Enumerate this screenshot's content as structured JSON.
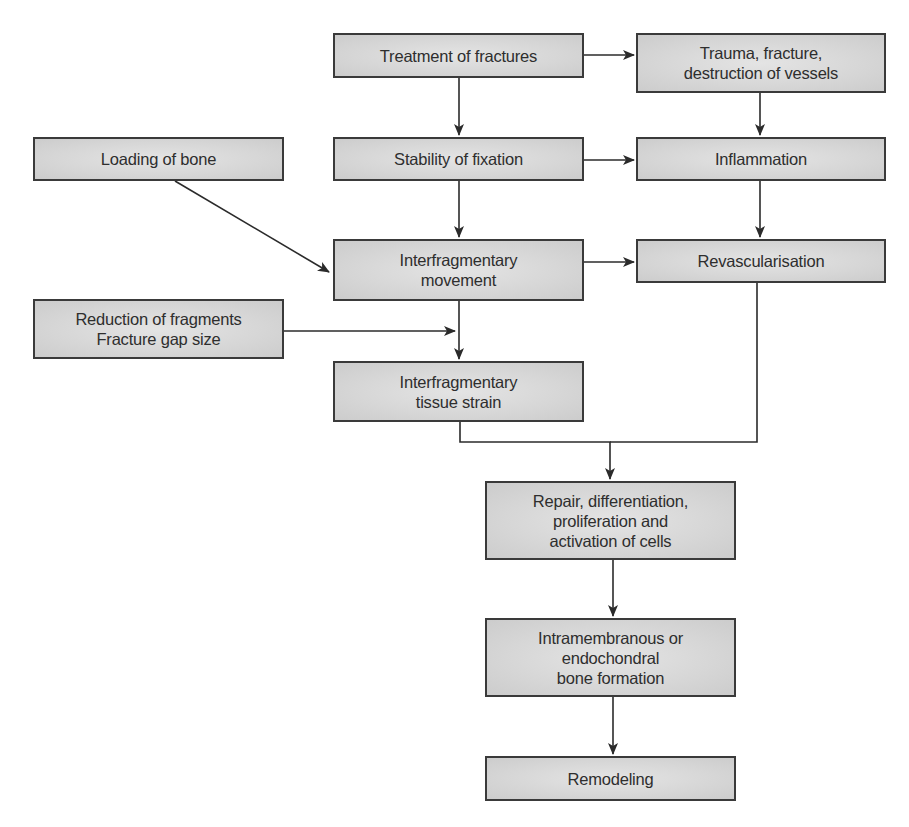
{
  "diagram": {
    "type": "flowchart",
    "nodes": [
      {
        "id": "treatment",
        "label": "Treatment of fractures",
        "x": 333,
        "y": 33,
        "w": 251,
        "h": 45
      },
      {
        "id": "trauma",
        "label": "Trauma, fracture,\ndestruction of vessels",
        "x": 636,
        "y": 33,
        "w": 250,
        "h": 60
      },
      {
        "id": "loading",
        "label": "Loading of bone",
        "x": 33,
        "y": 137,
        "w": 251,
        "h": 44
      },
      {
        "id": "stability",
        "label": "Stability of fixation",
        "x": 333,
        "y": 137,
        "w": 251,
        "h": 44
      },
      {
        "id": "inflammation",
        "label": "Inflammation",
        "x": 636,
        "y": 137,
        "w": 250,
        "h": 44
      },
      {
        "id": "movement",
        "label": "Interfragmentary\nmovement",
        "x": 333,
        "y": 239,
        "w": 251,
        "h": 62
      },
      {
        "id": "revascularisation",
        "label": "Revascularisation",
        "x": 636,
        "y": 239,
        "w": 250,
        "h": 44
      },
      {
        "id": "reduction",
        "label": "Reduction of fragments\nFracture gap size",
        "x": 33,
        "y": 299,
        "w": 251,
        "h": 60
      },
      {
        "id": "strain",
        "label": "Interfragmentary\ntissue strain",
        "x": 333,
        "y": 361,
        "w": 251,
        "h": 61
      },
      {
        "id": "repair",
        "label": "Repair, differentiation,\nproliferation and\nactivation of cells",
        "x": 485,
        "y": 481,
        "w": 251,
        "h": 79
      },
      {
        "id": "bone_formation",
        "label": "Intramembranous or\nendochondral\nbone formation",
        "x": 485,
        "y": 618,
        "w": 251,
        "h": 79
      },
      {
        "id": "remodeling",
        "label": "Remodeling",
        "x": 485,
        "y": 756,
        "w": 251,
        "h": 45
      }
    ],
    "edges": [
      {
        "from": "treatment",
        "to": "trauma",
        "points": [
          [
            584,
            55
          ],
          [
            634,
            55
          ]
        ]
      },
      {
        "from": "treatment",
        "to": "stability",
        "points": [
          [
            459,
            78
          ],
          [
            459,
            135
          ]
        ]
      },
      {
        "from": "trauma",
        "to": "inflammation",
        "points": [
          [
            760,
            93
          ],
          [
            760,
            135
          ]
        ]
      },
      {
        "from": "stability",
        "to": "inflammation",
        "points": [
          [
            584,
            160
          ],
          [
            634,
            160
          ]
        ]
      },
      {
        "from": "stability",
        "to": "movement",
        "points": [
          [
            459,
            181
          ],
          [
            459,
            237
          ]
        ]
      },
      {
        "from": "inflammation",
        "to": "revascularisation",
        "points": [
          [
            760,
            181
          ],
          [
            760,
            237
          ]
        ]
      },
      {
        "from": "loading",
        "to": "movement",
        "points": [
          [
            175,
            181
          ],
          [
            329,
            272
          ]
        ]
      },
      {
        "from": "movement",
        "to": "revascularisation",
        "points": [
          [
            584,
            262
          ],
          [
            634,
            262
          ]
        ]
      },
      {
        "from": "movement",
        "to": "strain",
        "points": [
          [
            459,
            301
          ],
          [
            459,
            359
          ]
        ]
      },
      {
        "from": "reduction",
        "to": "strain_input",
        "points": [
          [
            284,
            331
          ],
          [
            455,
            331
          ]
        ]
      },
      {
        "from": "strain",
        "to": "repair",
        "points": [
          [
            460,
            422
          ],
          [
            460,
            442
          ],
          [
            610,
            442
          ],
          [
            610,
            479
          ]
        ]
      },
      {
        "from": "revascularisation",
        "to": "repair",
        "points": [
          [
            757,
            283
          ],
          [
            757,
            442
          ],
          [
            610,
            442
          ]
        ],
        "arrow": false
      },
      {
        "from": "repair",
        "to": "bone_formation",
        "points": [
          [
            613,
            560
          ],
          [
            613,
            616
          ]
        ]
      },
      {
        "from": "bone_formation",
        "to": "remodeling",
        "points": [
          [
            613,
            697
          ],
          [
            613,
            754
          ]
        ]
      }
    ],
    "colors": {
      "box_fill": "#d8d8d8",
      "box_border": "#3a3a3a",
      "line": "#2b2b2b",
      "text": "#2e2e2e",
      "background": "#ffffff"
    }
  }
}
